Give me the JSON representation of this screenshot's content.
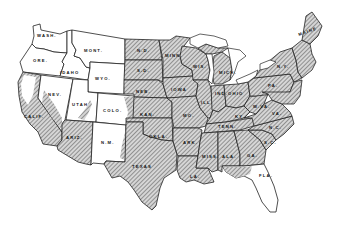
{
  "map": {
    "title": "United States",
    "colors": {
      "hatched_fill": "#c8c8c8",
      "hatch_line": "#555555",
      "plain_fill": "#ffffff",
      "border": "#222222"
    },
    "legend": [],
    "states": [
      {
        "id": "wash",
        "label": "WASH.",
        "shading": "plain"
      },
      {
        "id": "ore",
        "label": "ORE.",
        "shading": "plain"
      },
      {
        "id": "calif",
        "label": "CALIF.",
        "shading": "partial-hatched"
      },
      {
        "id": "idaho",
        "label": "IDAHO",
        "shading": "plain"
      },
      {
        "id": "nev",
        "label": "NEV.",
        "shading": "partial-hatched"
      },
      {
        "id": "mont",
        "label": "MONT.",
        "shading": "plain"
      },
      {
        "id": "wyo",
        "label": "WYO.",
        "shading": "plain"
      },
      {
        "id": "utah",
        "label": "UTAH",
        "shading": "partial-hatched"
      },
      {
        "id": "colo",
        "label": "COLO.",
        "shading": "partial-hatched"
      },
      {
        "id": "ariz",
        "label": "ARIZ.",
        "shading": "hatched"
      },
      {
        "id": "nm",
        "label": "N.M.",
        "shading": "plain"
      },
      {
        "id": "nd",
        "label": "N.D.",
        "shading": "hatched"
      },
      {
        "id": "sd",
        "label": "S.D.",
        "shading": "hatched"
      },
      {
        "id": "neb",
        "label": "NEB.",
        "shading": "hatched"
      },
      {
        "id": "kan",
        "label": "KAN.",
        "shading": "hatched"
      },
      {
        "id": "okla",
        "label": "OKLA.",
        "shading": "hatched"
      },
      {
        "id": "texas",
        "label": "TEXAS",
        "shading": "hatched"
      },
      {
        "id": "minn",
        "label": "MINN.",
        "shading": "hatched"
      },
      {
        "id": "iowa",
        "label": "IOWA",
        "shading": "hatched"
      },
      {
        "id": "mo",
        "label": "MO.",
        "shading": "hatched"
      },
      {
        "id": "ark",
        "label": "ARK.",
        "shading": "hatched"
      },
      {
        "id": "la",
        "label": "LA.",
        "shading": "hatched"
      },
      {
        "id": "wis",
        "label": "WIS.",
        "shading": "hatched"
      },
      {
        "id": "ill",
        "label": "ILL.",
        "shading": "hatched"
      },
      {
        "id": "mich",
        "label": "MICH.",
        "shading": "hatched"
      },
      {
        "id": "ind",
        "label": "IND.",
        "shading": "hatched"
      },
      {
        "id": "ohio",
        "label": "OHIO",
        "shading": "hatched"
      },
      {
        "id": "ky",
        "label": "KY.",
        "shading": "hatched"
      },
      {
        "id": "tenn",
        "label": "TENN.",
        "shading": "hatched"
      },
      {
        "id": "miss",
        "label": "MISS.",
        "shading": "hatched"
      },
      {
        "id": "ala",
        "label": "ALA.",
        "shading": "hatched"
      },
      {
        "id": "ga",
        "label": "GA.",
        "shading": "hatched"
      },
      {
        "id": "fla",
        "label": "FLA.",
        "shading": "partial-hatched"
      },
      {
        "id": "sc",
        "label": "S.C.",
        "shading": "hatched"
      },
      {
        "id": "nc",
        "label": "N.C.",
        "shading": "hatched"
      },
      {
        "id": "va",
        "label": "VA.",
        "shading": "hatched"
      },
      {
        "id": "wva",
        "label": "W.VA.",
        "shading": "hatched"
      },
      {
        "id": "pa",
        "label": "PA.",
        "shading": "hatched"
      },
      {
        "id": "ny",
        "label": "N.Y.",
        "shading": "hatched"
      },
      {
        "id": "maine",
        "label": "MAINE",
        "shading": "hatched"
      },
      {
        "id": "new-england",
        "label": "",
        "shading": "hatched"
      }
    ]
  }
}
